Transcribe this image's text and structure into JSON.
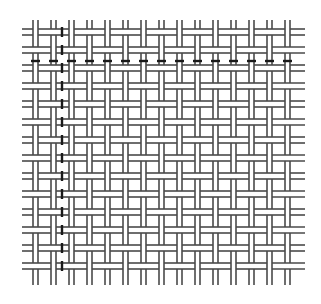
{
  "figure": {
    "type": "basket-weave pattern",
    "width": 321,
    "height": 304,
    "background": "#ffffff",
    "line_color": "#4a4a4a",
    "accent_color": "#1a1a1a",
    "line_width": 1.6,
    "extent": {
      "x_min": 22,
      "x_max": 305,
      "y_min": 20,
      "y_max": 285
    },
    "vertical_strips": {
      "count": 15,
      "start_x": 33,
      "period": 18,
      "gap": 5
    },
    "horizontal_strips": {
      "count": 14,
      "start_y": 29,
      "period": 18,
      "gap": 6
    },
    "highlighted_column_x": 62,
    "highlighted_row_y": 61
  }
}
